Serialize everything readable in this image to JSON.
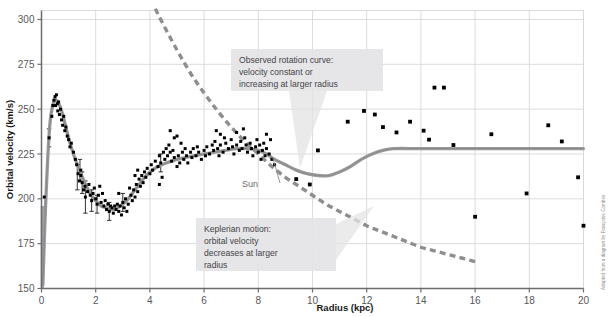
{
  "chart_data": {
    "type": "scatter",
    "title": "",
    "xlabel": "Radius (kpc)",
    "ylabel": "Orbital velocity (km/s)",
    "xlim": [
      0,
      20
    ],
    "ylim": [
      150,
      305
    ],
    "xticks": [
      0,
      2,
      4,
      6,
      8,
      10,
      12,
      14,
      16,
      18,
      20
    ],
    "yticks": [
      150,
      175,
      200,
      225,
      250,
      275,
      300
    ],
    "grid": true,
    "legend_position": "none",
    "series": [
      {
        "name": "Observed rotation curve (model)",
        "type": "line",
        "style": "solid-thick-gray",
        "color": "#9a9a9d",
        "x": [
          0.05,
          0.15,
          0.3,
          0.45,
          0.55,
          0.7,
          0.85,
          1.0,
          1.2,
          1.4,
          1.6,
          1.8,
          2.0,
          2.2,
          2.4,
          2.6,
          2.8,
          3.0,
          3.2,
          3.4,
          3.6,
          3.8,
          4.0,
          4.3,
          4.6,
          5.0,
          5.3,
          5.6,
          6.0,
          6.4,
          6.8,
          7.2,
          7.6,
          8.0,
          8.3,
          8.6,
          9.0,
          9.4,
          9.8,
          10.2,
          10.6,
          11.0,
          11.4,
          11.8,
          12.2,
          12.6,
          13.0,
          14.0,
          15.0,
          16.0,
          17.0,
          18.0,
          19.0,
          20.0
        ],
        "y": [
          152,
          196,
          240,
          254,
          255,
          251,
          243,
          234,
          224,
          216,
          209,
          203,
          199,
          196,
          195,
          194,
          195,
          197,
          200,
          204,
          208,
          212,
          215,
          218,
          220,
          222,
          223,
          224,
          225,
          226,
          227,
          228,
          228,
          227,
          225,
          222,
          219,
          216,
          214,
          213,
          213,
          215,
          218,
          222,
          225,
          227,
          228,
          228,
          228,
          228,
          228,
          228,
          228,
          228
        ]
      },
      {
        "name": "Keplerian motion",
        "type": "line",
        "style": "dashed-gray",
        "color": "#8e8e91",
        "x": [
          4.2,
          4.5,
          5.0,
          5.5,
          6.0,
          6.5,
          7.0,
          7.5,
          8.0,
          8.5,
          9.0,
          9.5,
          10.0,
          10.5,
          11.0,
          11.5,
          12.0,
          12.5,
          13.0,
          13.5,
          14.0,
          14.5,
          15.0,
          15.5,
          16.0
        ],
        "y": [
          306,
          297,
          283,
          270,
          259,
          249,
          240,
          232,
          225,
          218,
          212,
          207,
          202,
          197,
          193,
          189,
          185,
          182,
          179,
          176,
          173,
          171,
          169,
          167,
          165
        ]
      },
      {
        "name": "Observed data points",
        "type": "scatter",
        "color": "#000000",
        "points": [
          [
            0.1,
            201
          ],
          [
            0.28,
            234
          ],
          [
            0.38,
            246
          ],
          [
            0.42,
            252
          ],
          [
            0.46,
            255
          ],
          [
            0.5,
            257
          ],
          [
            0.52,
            252
          ],
          [
            0.55,
            258
          ],
          [
            0.58,
            253
          ],
          [
            0.6,
            249
          ],
          [
            0.63,
            254
          ],
          [
            0.66,
            247
          ],
          [
            0.7,
            250
          ],
          [
            0.74,
            244
          ],
          [
            0.78,
            241
          ],
          [
            0.82,
            246
          ],
          [
            0.86,
            238
          ],
          [
            0.9,
            240
          ],
          [
            0.95,
            235
          ],
          [
            1.0,
            233
          ],
          [
            1.05,
            229
          ],
          [
            1.1,
            231
          ],
          [
            1.18,
            226
          ],
          [
            1.25,
            222
          ],
          [
            1.3,
            219
          ],
          [
            1.35,
            214
          ],
          [
            1.4,
            210
          ],
          [
            1.45,
            213
          ],
          [
            1.5,
            209
          ],
          [
            1.55,
            205
          ],
          [
            1.6,
            207
          ],
          [
            1.62,
            201
          ],
          [
            1.7,
            204
          ],
          [
            1.75,
            208
          ],
          [
            1.8,
            202
          ],
          [
            1.85,
            199
          ],
          [
            1.9,
            203
          ],
          [
            1.95,
            206
          ],
          [
            2.0,
            200
          ],
          [
            2.05,
            197
          ],
          [
            2.1,
            202
          ],
          [
            2.2,
            198
          ],
          [
            2.25,
            203
          ],
          [
            2.3,
            196
          ],
          [
            2.35,
            199
          ],
          [
            2.4,
            194
          ],
          [
            2.45,
            197
          ],
          [
            2.5,
            193
          ],
          [
            2.55,
            196
          ],
          [
            2.6,
            195
          ],
          [
            2.65,
            192
          ],
          [
            2.7,
            196
          ],
          [
            2.75,
            194
          ],
          [
            2.8,
            197
          ],
          [
            2.85,
            193
          ],
          [
            2.9,
            196
          ],
          [
            2.95,
            191
          ],
          [
            3.0,
            198
          ],
          [
            3.05,
            195
          ],
          [
            3.1,
            200
          ],
          [
            3.15,
            193
          ],
          [
            3.2,
            197
          ],
          [
            3.3,
            202
          ],
          [
            3.35,
            199
          ],
          [
            3.4,
            205
          ],
          [
            3.45,
            201
          ],
          [
            3.5,
            208
          ],
          [
            3.55,
            204
          ],
          [
            3.6,
            211
          ],
          [
            3.65,
            207
          ],
          [
            3.7,
            213
          ],
          [
            3.75,
            209
          ],
          [
            3.8,
            215
          ],
          [
            3.85,
            212
          ],
          [
            3.9,
            217
          ],
          [
            4.0,
            214
          ],
          [
            4.05,
            219
          ],
          [
            4.1,
            216
          ],
          [
            4.2,
            221
          ],
          [
            4.3,
            218
          ],
          [
            4.35,
            224
          ],
          [
            4.4,
            220
          ],
          [
            4.5,
            226
          ],
          [
            4.55,
            222
          ],
          [
            4.6,
            228
          ],
          [
            4.65,
            224
          ],
          [
            4.7,
            230
          ],
          [
            4.75,
            226
          ],
          [
            4.8,
            221
          ],
          [
            4.85,
            227
          ],
          [
            4.9,
            223
          ],
          [
            5.0,
            218
          ],
          [
            5.05,
            224
          ],
          [
            5.1,
            220
          ],
          [
            5.2,
            226
          ],
          [
            5.25,
            222
          ],
          [
            5.3,
            228
          ],
          [
            5.35,
            224
          ],
          [
            5.4,
            220
          ],
          [
            5.5,
            226
          ],
          [
            5.55,
            223
          ],
          [
            5.6,
            228
          ],
          [
            5.7,
            224
          ],
          [
            5.75,
            229
          ],
          [
            5.8,
            226
          ],
          [
            5.9,
            222
          ],
          [
            6.0,
            227
          ],
          [
            6.05,
            224
          ],
          [
            6.1,
            229
          ],
          [
            6.2,
            225
          ],
          [
            6.3,
            230
          ],
          [
            6.35,
            227
          ],
          [
            6.4,
            232
          ],
          [
            6.5,
            228
          ],
          [
            6.55,
            224
          ],
          [
            6.6,
            230
          ],
          [
            6.7,
            226
          ],
          [
            6.8,
            231
          ],
          [
            6.9,
            228
          ],
          [
            7.0,
            233
          ],
          [
            7.05,
            229
          ],
          [
            7.1,
            225
          ],
          [
            7.2,
            230
          ],
          [
            7.3,
            227
          ],
          [
            7.35,
            232
          ],
          [
            7.4,
            228
          ],
          [
            7.5,
            234
          ],
          [
            7.55,
            230
          ],
          [
            7.6,
            226
          ],
          [
            7.7,
            231
          ],
          [
            7.75,
            228
          ],
          [
            7.8,
            224
          ],
          [
            7.9,
            229
          ],
          [
            7.95,
            233
          ],
          [
            8.0,
            226
          ],
          [
            8.05,
            230
          ],
          [
            8.1,
            222
          ],
          [
            8.15,
            227
          ],
          [
            8.2,
            231
          ],
          [
            8.25,
            224
          ],
          [
            8.3,
            228
          ],
          [
            8.4,
            225
          ],
          [
            8.5,
            222
          ],
          [
            8.6,
            219
          ],
          [
            8.3,
            236
          ],
          [
            8.45,
            233
          ],
          [
            5.0,
            235
          ],
          [
            4.75,
            238
          ],
          [
            4.9,
            234
          ],
          [
            5.15,
            231
          ],
          [
            6.6,
            236
          ],
          [
            6.75,
            234
          ],
          [
            7.2,
            237
          ],
          [
            7.45,
            239
          ],
          [
            6.45,
            238
          ],
          [
            3.55,
            216
          ],
          [
            3.45,
            213
          ],
          [
            4.35,
            208
          ],
          [
            4.45,
            212
          ],
          [
            1.45,
            216
          ],
          [
            2.15,
            207
          ],
          [
            2.85,
            203
          ],
          [
            3.25,
            206
          ],
          [
            9.4,
            211
          ],
          [
            9.9,
            208
          ],
          [
            10.2,
            227
          ],
          [
            11.3,
            243
          ],
          [
            11.9,
            249
          ],
          [
            12.3,
            247
          ],
          [
            12.6,
            240
          ],
          [
            13.1,
            237
          ],
          [
            13.6,
            243
          ],
          [
            14.1,
            238
          ],
          [
            14.3,
            233
          ],
          [
            14.5,
            262
          ],
          [
            14.85,
            262
          ],
          [
            15.2,
            230
          ],
          [
            16.0,
            190
          ],
          [
            16.6,
            236
          ],
          [
            17.9,
            203
          ],
          [
            18.7,
            241
          ],
          [
            19.2,
            232
          ],
          [
            19.8,
            212
          ],
          [
            20.0,
            185
          ]
        ]
      }
    ],
    "annotations": [
      {
        "name": "observed-rotation-callout",
        "text": "Observed rotation curve: velocity constant or increasing at larger radius",
        "lines": [
          "Observed rotation curve:",
          "velocity constant or",
          "increasing at larger radius"
        ]
      },
      {
        "name": "keplerian-callout",
        "text": "Keplerian motion: orbital velocity decreases at larger radius",
        "lines": [
          "Keplerian motion:",
          "orbital velocity",
          "decreases at larger",
          "radius"
        ]
      },
      {
        "name": "sun-marker",
        "text": "Sun",
        "x": 8.5,
        "y": 225
      }
    ]
  },
  "credit": {
    "text": "Adapted from a diagram by Françoise Combes"
  },
  "colors": {
    "grid": "#d8d8dc",
    "axis": "#6d6d70",
    "model_curve": "#9a9a9d",
    "kepler_curve": "#8e8e91",
    "data_point": "#000000",
    "callout_bg": "#e4e4e6",
    "text": "#444447"
  }
}
